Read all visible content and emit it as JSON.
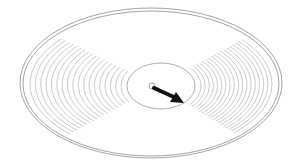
{
  "diagram": {
    "elements": {
      "outer_rim": {
        "cx": 151,
        "cy": 83,
        "rx": 131,
        "ry": 75
      },
      "inner_hub": {
        "cx": 161,
        "cy": 86,
        "rx": 34,
        "ry": 23
      },
      "track_count": 18,
      "arrow": {
        "from": [
          152,
          86
        ],
        "to": [
          183,
          102
        ],
        "direction": "outward"
      },
      "spindle_hole": {
        "cx": 152,
        "cy": 86,
        "r": 3
      }
    },
    "colors": {
      "background": "#ffffff",
      "tracks": "#b5b5b5",
      "rim": "#9a9a9a",
      "arrow": "#111111"
    }
  }
}
